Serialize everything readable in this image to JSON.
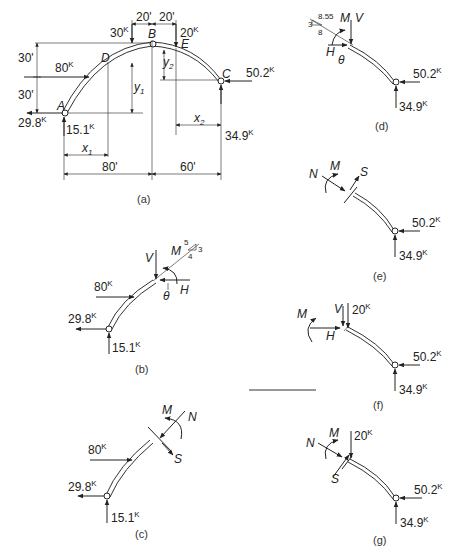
{
  "figure": {
    "panels": [
      {
        "id": "a",
        "caption": "(a)",
        "points": {
          "A": "A",
          "B": "B",
          "C": "C",
          "D": "D",
          "E": "E"
        },
        "loads": {
          "load_30": "30",
          "load_80": "80",
          "load_20": "20",
          "kip": "K"
        },
        "reactions": {
          "HA": "29.8",
          "VA": "15.1",
          "HC": "50.2",
          "VC": "34.9"
        },
        "dimensions": {
          "top_30": "30'",
          "bot_30": "30'",
          "left_20": "20'",
          "right_20": "20'",
          "span_left": "80'",
          "span_right": "60'"
        },
        "variables": {
          "x1": "x",
          "x1_sub": "1",
          "y1": "y",
          "y1_sub": "1",
          "x2": "x",
          "x2_sub": "2",
          "y2": "y",
          "y2_sub": "2"
        }
      },
      {
        "id": "b",
        "caption": "(b)",
        "labels": {
          "V": "V",
          "M": "M",
          "H": "H",
          "theta": "θ",
          "slope_5": "5",
          "slope_3": "3",
          "slope_4": "4"
        },
        "loads": {
          "load_80": "80",
          "HA": "29.8",
          "VA": "15.1",
          "kip": "K"
        }
      },
      {
        "id": "c",
        "caption": "(c)",
        "labels": {
          "M": "M",
          "N": "N",
          "S": "S"
        },
        "loads": {
          "load_80": "80",
          "HA": "29.8",
          "VA": "15.1",
          "kip": "K"
        }
      },
      {
        "id": "d",
        "caption": "(d)",
        "labels": {
          "M": "M",
          "V": "V",
          "H": "H",
          "theta": "θ",
          "slope_hyp": "8.55",
          "slope_3": "3",
          "slope_8": "8"
        },
        "loads": {
          "HC": "50.2",
          "VC": "34.9",
          "kip": "K"
        }
      },
      {
        "id": "e",
        "caption": "(e)",
        "labels": {
          "N": "N",
          "M": "M",
          "S": "S"
        },
        "loads": {
          "HC": "50.2",
          "VC": "34.9",
          "kip": "K"
        }
      },
      {
        "id": "f",
        "caption": "(f)",
        "labels": {
          "M": "M",
          "V": "V",
          "H": "H"
        },
        "loads": {
          "load_20": "20",
          "HC": "50.2",
          "VC": "34.9",
          "kip": "K"
        }
      },
      {
        "id": "g",
        "caption": "(g)",
        "labels": {
          "N": "N",
          "M": "M",
          "S": "S"
        },
        "loads": {
          "load_20": "20",
          "HC": "50.2",
          "VC": "34.9",
          "kip": "K"
        }
      }
    ]
  }
}
